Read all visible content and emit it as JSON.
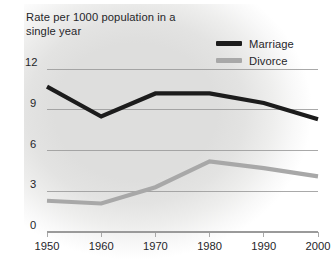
{
  "chart_data": {
    "type": "line",
    "title": "Rate per 1000 population in a single year",
    "xlabel": "",
    "ylabel": "",
    "x": [
      1950,
      1960,
      1970,
      1980,
      1990,
      2000
    ],
    "categories": [
      "1950",
      "1960",
      "1970",
      "1980",
      "1990",
      "2000"
    ],
    "series": [
      {
        "name": "Marriage",
        "color": "#1c1c1c",
        "values": [
          10.7,
          8.5,
          10.2,
          10.2,
          9.5,
          8.3
        ]
      },
      {
        "name": "Divorce",
        "color": "#a8a8a8",
        "values": [
          2.3,
          2.1,
          3.3,
          5.2,
          4.7,
          4.1
        ]
      }
    ],
    "ylim": [
      0,
      12
    ],
    "yticks": [
      0,
      3,
      6,
      9,
      12
    ],
    "ytick_labels": [
      "0",
      "3",
      "6",
      "9",
      "12"
    ],
    "xlim": [
      1950,
      2000
    ],
    "grid": true,
    "grid_color": "#9a9a9a",
    "legend_position": "top-right",
    "background_color": "#dededd"
  },
  "legend": {
    "entries": [
      {
        "label": "Marriage"
      },
      {
        "label": "Divorce"
      }
    ]
  }
}
